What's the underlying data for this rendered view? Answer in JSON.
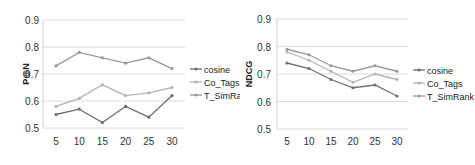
{
  "chart_data": [
    {
      "type": "line",
      "title": "",
      "xlabel": "",
      "ylabel": "P@N",
      "x": [
        5,
        10,
        15,
        20,
        25,
        30
      ],
      "categories": [
        "5",
        "10",
        "15",
        "20",
        "25",
        "30"
      ],
      "ylim": [
        0.5,
        0.9
      ],
      "yticks": [
        "0.5",
        "0.6",
        "0.7",
        "0.8",
        "0.9"
      ],
      "grid": true,
      "legend_position": "right",
      "series": [
        {
          "name": "cosine",
          "color": "#6e6e6e",
          "values": [
            0.55,
            0.57,
            0.52,
            0.58,
            0.54,
            0.62
          ]
        },
        {
          "name": "Co_Tags",
          "color": "#b4b4b4",
          "values": [
            0.58,
            0.61,
            0.66,
            0.62,
            0.63,
            0.65
          ]
        },
        {
          "name": "T_SimRank",
          "color": "#9a9a9a",
          "values": [
            0.73,
            0.78,
            0.76,
            0.74,
            0.76,
            0.72
          ]
        }
      ]
    },
    {
      "type": "line",
      "title": "",
      "xlabel": "",
      "ylabel": "NDCG",
      "x": [
        5,
        10,
        15,
        20,
        25,
        30
      ],
      "categories": [
        "5",
        "10",
        "15",
        "20",
        "25",
        "30"
      ],
      "ylim": [
        0.5,
        0.9
      ],
      "yticks": [
        "0.5",
        "0.6",
        "0.7",
        "0.8",
        "0.9"
      ],
      "grid": true,
      "legend_position": "right",
      "series": [
        {
          "name": "cosine",
          "color": "#6e6e6e",
          "values": [
            0.74,
            0.72,
            0.68,
            0.65,
            0.66,
            0.62
          ]
        },
        {
          "name": "Co_Tags",
          "color": "#b4b4b4",
          "values": [
            0.78,
            0.75,
            0.71,
            0.67,
            0.7,
            0.68
          ]
        },
        {
          "name": "T_SimRank",
          "color": "#9a9a9a",
          "values": [
            0.79,
            0.77,
            0.73,
            0.71,
            0.73,
            0.71
          ]
        }
      ]
    }
  ]
}
